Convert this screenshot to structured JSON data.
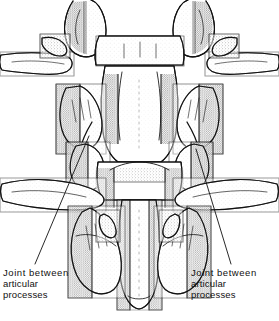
{
  "figure": {
    "kind": "anatomical-line-drawing",
    "view": "posterior",
    "style": "black ink line art with stipple shading",
    "background_color": "#ffffff",
    "ink_color": "#111111"
  },
  "callouts": [
    {
      "id": "left",
      "lines": [
        "Joint  between",
        "articular",
        "processes"
      ],
      "leader": {
        "from_x": 35,
        "from_y": 264,
        "to_x": 89,
        "to_y": 136
      }
    },
    {
      "id": "right",
      "lines": [
        "Joint  between",
        "articular",
        "processes"
      ],
      "leader": {
        "from_x": 231,
        "from_y": 264,
        "to_x": 196,
        "to_y": 149
      }
    }
  ]
}
